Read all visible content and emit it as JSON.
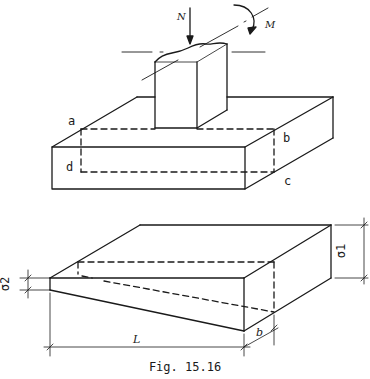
{
  "figure": {
    "caption": "Fig. 15.16",
    "top_view": {
      "force_label": "N",
      "moment_label": "M",
      "corner_labels": {
        "a": "a",
        "b": "b",
        "c": "c",
        "d": "d"
      }
    },
    "bottom_view": {
      "stress_max_label": "σ1",
      "stress_min_label": "σ2",
      "length_label": "L",
      "width_label": "b"
    },
    "colors": {
      "line": "#1a1a1a",
      "background": "#ffffff"
    }
  }
}
